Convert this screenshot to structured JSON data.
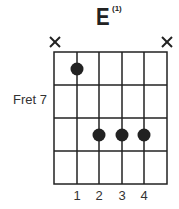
{
  "chord": {
    "name": "E",
    "superscript": "(1)",
    "fret_label": "Fret 7",
    "muted_strings": [
      1,
      6
    ],
    "finger_numbers": [
      "1",
      "2",
      "3",
      "4"
    ],
    "dots": [
      {
        "string": 2,
        "fret": 1
      },
      {
        "string": 3,
        "fret": 3
      },
      {
        "string": 4,
        "fret": 3
      },
      {
        "string": 5,
        "fret": 3
      }
    ],
    "strings": 6,
    "frets": 4
  }
}
